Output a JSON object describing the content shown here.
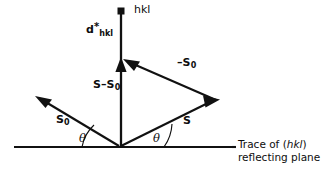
{
  "figure": {
    "kind": "vector-diagram",
    "stroke_color": "#111111",
    "background_color": "#ffffff"
  },
  "labels": {
    "hkl_node": "hkl",
    "d_star": {
      "symbol": "d",
      "superscript": "*",
      "subscript": "hkl"
    },
    "scattering_vector": {
      "text": "S–S",
      "subscript": "0"
    },
    "minus_s0": {
      "text": "–S",
      "subscript": "0"
    },
    "s0": {
      "text": "S",
      "subscript": "0"
    },
    "s": "S",
    "theta_left": "θ",
    "theta_right": "θ",
    "trace_caption": {
      "line1_prefix": "Trace of (",
      "line1_italic": "hkl",
      "line1_suffix": ")",
      "line2": "reflecting plane"
    }
  },
  "geometry": {
    "origin": {
      "x": 121,
      "y": 147
    },
    "trace_line": {
      "x1": 14,
      "y1": 147,
      "x2": 232,
      "y2": 147
    },
    "d_star_axis": {
      "x1": 121,
      "y1": 13,
      "x2": 121,
      "y2": 147
    },
    "node_marker": {
      "x": 121,
      "y": 11,
      "size": 6,
      "shape": "filled-square"
    },
    "s_minus_s0_arrow_tip": {
      "x": 121,
      "y": 61
    },
    "s0_arrow_tip": {
      "x": 37,
      "y": 98
    },
    "s_arrow_tip": {
      "x": 219,
      "y": 100
    },
    "minus_s0_from": {
      "x": 217,
      "y": 101
    },
    "minus_s0_to": {
      "x": 124,
      "y": 60
    },
    "theta_left_deg": 28,
    "theta_right_deg": 26
  }
}
